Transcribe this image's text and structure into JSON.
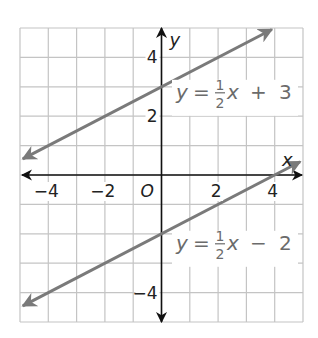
{
  "chart_data": {
    "type": "line",
    "title": "",
    "xlabel": "x",
    "ylabel": "y",
    "xlim": [
      -5,
      5
    ],
    "ylim": [
      -5,
      5
    ],
    "grid": true,
    "grid_step": 1,
    "origin_label": "O",
    "x_ticks": [
      {
        "value": -4,
        "label": "−4"
      },
      {
        "value": -2,
        "label": "−2"
      },
      {
        "value": 2,
        "label": "2"
      },
      {
        "value": 4,
        "label": "4"
      }
    ],
    "y_ticks": [
      {
        "value": 4,
        "label": "4"
      },
      {
        "value": 2,
        "label": "2"
      },
      {
        "value": -4,
        "label": "−4"
      }
    ],
    "series": [
      {
        "name": "y = ½x + 3",
        "slope": 0.5,
        "intercept": 3,
        "x": [
          -4.9,
          3.9
        ],
        "y": [
          0.55,
          4.95
        ],
        "label": {
          "lhs": "y",
          "eq": "=",
          "num": "1",
          "den": "2",
          "var": "x",
          "op": "+",
          "const": "3"
        }
      },
      {
        "name": "y = ½x − 2",
        "slope": 0.5,
        "intercept": -2,
        "x": [
          -4.9,
          4.9
        ],
        "y": [
          -4.45,
          0.45
        ],
        "label": {
          "lhs": "y",
          "eq": "=",
          "num": "1",
          "den": "2",
          "var": "x",
          "op": "−",
          "const": "2"
        }
      }
    ],
    "colors": {
      "line": "#7a7a7a",
      "axis": "#111111",
      "grid": "#c4c4c4",
      "text": "#222222",
      "eq_text": "#6b6b6b"
    }
  }
}
